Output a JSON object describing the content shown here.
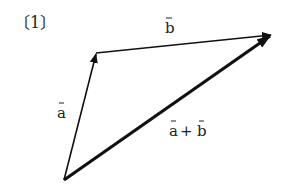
{
  "figure": {
    "problem_label": "〔1〕",
    "vectors": [
      {
        "id": "a",
        "label": "a",
        "from": [
          64,
          180
        ],
        "to": [
          96,
          53
        ]
      },
      {
        "id": "b",
        "label": "b",
        "from": [
          96,
          53
        ],
        "to": [
          272,
          34
        ]
      },
      {
        "id": "a_plus_b",
        "label_a": "a",
        "plus": "+",
        "label_b": "b",
        "from": [
          64,
          180
        ],
        "to": [
          272,
          34
        ]
      }
    ],
    "colors": {
      "stroke": "#111111",
      "background": "#ffffff"
    }
  }
}
